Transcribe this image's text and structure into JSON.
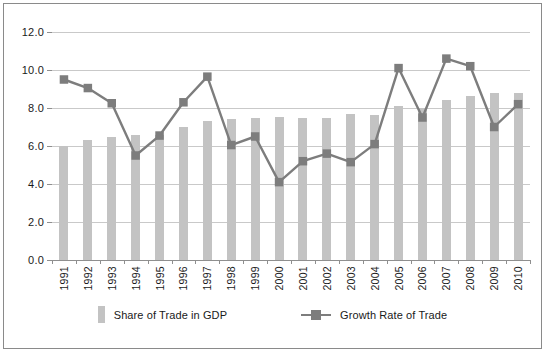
{
  "chart_data": {
    "type": "bar",
    "title": "",
    "subtitle": "",
    "xlabel": "",
    "ylabel": "",
    "ylim": [
      0.0,
      12.0
    ],
    "ytick_step": 2.0,
    "ytick_labels": [
      "0.0",
      "2.0",
      "4.0",
      "6.0",
      "8.0",
      "10.0",
      "12.0"
    ],
    "ytick_values": [
      0.0,
      2.0,
      4.0,
      6.0,
      8.0,
      10.0,
      12.0
    ],
    "grid": true,
    "legend_position": "bottom-center",
    "categories": [
      "1991",
      "1992",
      "1993",
      "1994",
      "1995",
      "1996",
      "1997",
      "1998",
      "1999",
      "2000",
      "2001",
      "2002",
      "2003",
      "2004",
      "2005",
      "2006",
      "2007",
      "2008",
      "2009",
      "2010"
    ],
    "series": [
      {
        "name": "Share of Trade in GDP",
        "type": "bar",
        "color": "#c3c3c3",
        "values": [
          6.0,
          6.3,
          6.5,
          6.6,
          6.6,
          7.0,
          7.3,
          7.4,
          7.5,
          7.55,
          7.5,
          7.5,
          7.7,
          7.65,
          8.1,
          8.0,
          8.4,
          8.65,
          8.8,
          8.8
        ]
      },
      {
        "name": "Growth Rate of Trade",
        "type": "line",
        "color": "#7d7d7d",
        "marker": "square",
        "values": [
          9.5,
          9.05,
          8.25,
          5.5,
          6.55,
          8.3,
          9.65,
          6.05,
          6.5,
          4.1,
          5.2,
          5.6,
          5.15,
          6.1,
          10.1,
          7.5,
          10.6,
          10.2,
          7.0,
          8.2
        ]
      }
    ]
  },
  "legend": {
    "items": [
      {
        "label": "Share of Trade in GDP",
        "swatch": "bar-swatch"
      },
      {
        "label": "Growth Rate of Trade",
        "swatch": "line-marker-swatch"
      }
    ]
  },
  "colors": {
    "bar": "#c3c3c3",
    "line": "#7d7d7d",
    "gridline": "#c9c9c9",
    "axis": "#8f8f8f",
    "frame": "#8a8a8a",
    "text": "#1a1a1a",
    "background": "#ffffff"
  }
}
